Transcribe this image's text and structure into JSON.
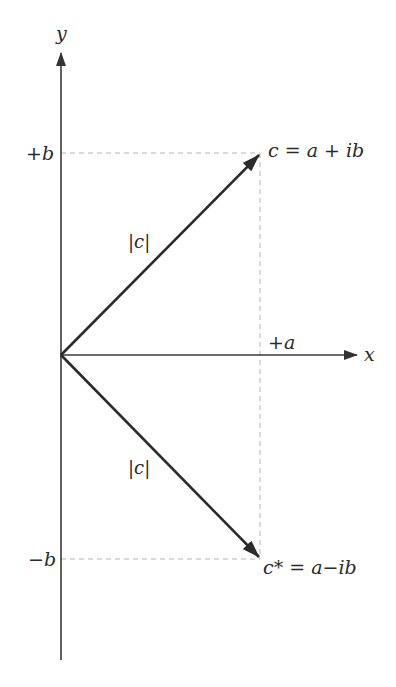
{
  "diagram": {
    "axes": {
      "x_label": "x",
      "y_label": "y"
    },
    "tick_labels": {
      "plus_b": "+b",
      "minus_b": "−b",
      "plus_a": "+a"
    },
    "vectors": [
      {
        "name": "c",
        "label": "c = a + ib",
        "magnitude_label": "|c|",
        "direction": "up-right"
      },
      {
        "name": "c-conjugate",
        "label": "c* = a−ib",
        "magnitude_label": "|c|",
        "direction": "down-right"
      }
    ],
    "colors": {
      "axis": "#3a3a3a",
      "vector": "#2b2b2b",
      "guide": "#b5b5b5",
      "text": "#2a2a2a",
      "background": "#ffffff"
    }
  }
}
